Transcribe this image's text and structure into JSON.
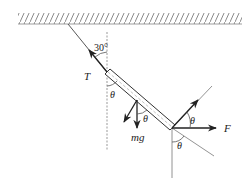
{
  "diagram": {
    "type": "free-body force diagram",
    "labels": {
      "tension": "T",
      "weight": "mg",
      "applied_force": "F",
      "angle_string": "30°",
      "theta_rod_vertical": "θ",
      "theta_weight": "θ",
      "theta_force_top": "θ",
      "theta_force_bottom": "θ"
    },
    "colors": {
      "line": "#333333",
      "thin_line": "#777777",
      "dashed": "#999999",
      "hatch": "#888888"
    }
  }
}
